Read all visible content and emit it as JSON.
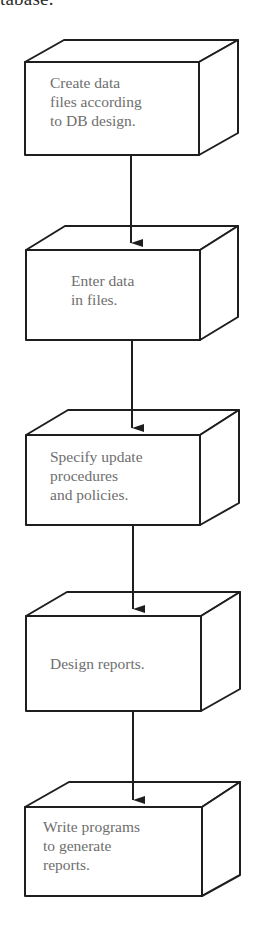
{
  "caption_fragment": "tabase.",
  "flow": {
    "direction": "top-to-bottom",
    "steps": [
      {
        "id": 1,
        "label": "Create data\nfiles according\nto DB design."
      },
      {
        "id": 2,
        "label": "Enter data\nin files."
      },
      {
        "id": 3,
        "label": "Specify update\nprocedures\nand policies."
      },
      {
        "id": 4,
        "label": "Design reports."
      },
      {
        "id": 5,
        "label": "Write programs\nto generate\nreports."
      }
    ],
    "connectors": [
      {
        "from": 1,
        "to": 2
      },
      {
        "from": 2,
        "to": 3
      },
      {
        "from": 3,
        "to": 4
      },
      {
        "from": 4,
        "to": 5
      }
    ]
  },
  "colors": {
    "stroke": "#1e1e1e",
    "text": "#6e6e6e",
    "background": "#ffffff"
  }
}
